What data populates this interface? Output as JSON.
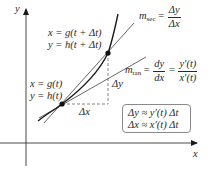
{
  "figure": {
    "axes": {
      "x_label": "x",
      "y_label": "y"
    },
    "point_lower": {
      "line1": "x = g(t)",
      "line2": "y = h(t)"
    },
    "point_upper": {
      "line1": "x = g(t + Δt)",
      "line2": "y = h(t + Δt)"
    },
    "delta_x_label": "Δx",
    "delta_y_label": "Δy",
    "secant": {
      "label_m": "m",
      "label_sub": "sec",
      "eq": "=",
      "num": "Δy",
      "den": "Δx"
    },
    "tangent": {
      "label_m": "m",
      "label_sub": "tan",
      "eq1": "=",
      "num1": "dy",
      "den1": "dx",
      "eq2": "=",
      "num2": "y′(t)",
      "den2": "x′(t)"
    },
    "approx_box": {
      "line1": "Δy ≈ y′(t) Δt",
      "line2": "Δx ≈ x′(t) Δt"
    },
    "colors": {
      "curve": "#1a1a1a",
      "lines": "#555555",
      "axis": "#333333",
      "dashed": "#777777",
      "box_border": "#8a8a8a"
    }
  }
}
